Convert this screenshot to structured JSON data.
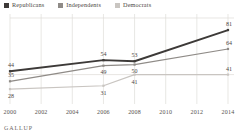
{
  "legend": {
    "entries": [
      {
        "label": "Republicans",
        "color": "#3d3a38"
      },
      {
        "label": "Independents",
        "color": "#8f8b87"
      },
      {
        "label": "Democrats",
        "color": "#c9c5c1"
      }
    ]
  },
  "footer": {
    "brand": "GALLUP"
  },
  "chart_data": {
    "type": "line",
    "title": "",
    "xlabel": "",
    "ylabel": "",
    "x": [
      2000,
      2002,
      2004,
      2006,
      2008,
      2010,
      2012,
      2014
    ],
    "categories": [
      "2000",
      "2002",
      "2004",
      "2006",
      "2008",
      "2010",
      "2012",
      "2014"
    ],
    "xlim": [
      2000,
      2014
    ],
    "ylim": [
      20,
      90
    ],
    "grid": "vertical",
    "legend_position": "top-left",
    "series": [
      {
        "name": "Republicans",
        "color": "#3d3a38",
        "x": [
          2000,
          2006,
          2008,
          2014
        ],
        "values": [
          44,
          54,
          53,
          81
        ],
        "labels": [
          "44",
          "54",
          "53",
          "81"
        ]
      },
      {
        "name": "Independents",
        "color": "#8f8b87",
        "x": [
          2000,
          2006,
          2008,
          2014
        ],
        "values": [
          35,
          49,
          50,
          64
        ],
        "labels": [
          "35",
          "49",
          "50",
          "64"
        ]
      },
      {
        "name": "Democrats",
        "color": "#c9c5c1",
        "x": [
          2000,
          2006,
          2008,
          2014
        ],
        "values": [
          28,
          31,
          41,
          41
        ],
        "labels": [
          "28",
          "31",
          "41",
          "41"
        ]
      }
    ]
  }
}
